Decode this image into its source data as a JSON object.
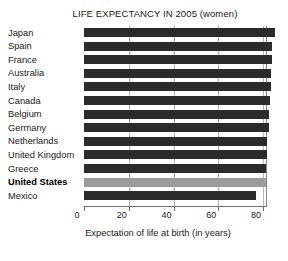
{
  "chart_data": {
    "type": "bar",
    "orientation": "horizontal",
    "title": "LIFE EXPECTANCY IN 2005 (women)",
    "xlabel": "Expectation of life at birth (in years)",
    "ylabel": "",
    "categories": [
      "Japan",
      "Spain",
      "France",
      "Australia",
      "Italy",
      "Canada",
      "Belgium",
      "Germany",
      "Netherlands",
      "United Kingdom",
      "Greece",
      "United States",
      "Mexico"
    ],
    "values": [
      85.5,
      84.0,
      84.0,
      83.5,
      83.5,
      83.0,
      82.5,
      82.5,
      82.0,
      82.0,
      81.5,
      81.5,
      77.0
    ],
    "xlim": [
      0,
      85.5
    ],
    "xticks": [
      0,
      20,
      40,
      60,
      80
    ],
    "xtick_labels": [
      "0",
      "20",
      "40",
      "60",
      "80"
    ],
    "grid": "vertical",
    "legend": "none",
    "highlight_category": "United States",
    "colors": {
      "bar": "#2b2b2b",
      "bar_highlight": "#9b9b9b",
      "background": "#ffffff",
      "text": "#1a1a1a",
      "gridline": "#b9b9b9",
      "axis": "#6e6e6e"
    }
  }
}
